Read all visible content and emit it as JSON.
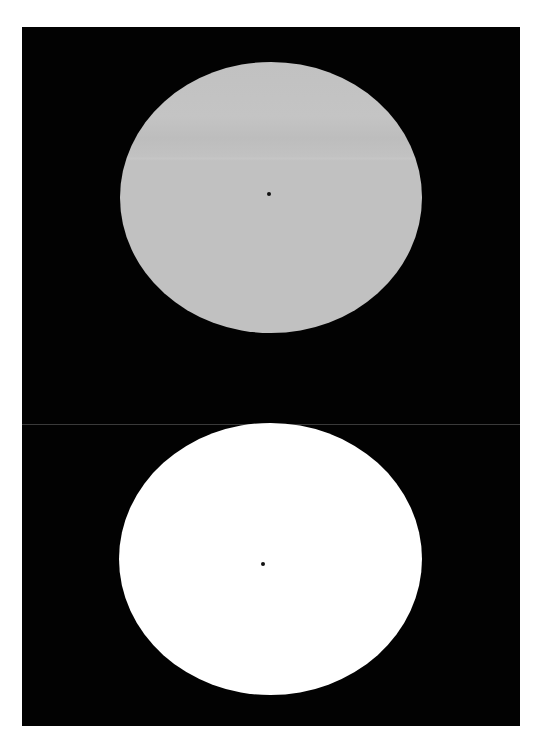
{
  "canvas": {
    "width": 543,
    "height": 751,
    "background": "#ffffff"
  },
  "panel": {
    "color": "#020202",
    "divider_color": "#3a3a3a"
  },
  "stimuli": [
    {
      "name": "top-frame",
      "ellipse_color": "#c1c1c1",
      "dot_color": "#111111",
      "dot_center": [
        269,
        194
      ]
    },
    {
      "name": "bottom-frame",
      "ellipse_color": "#ffffff",
      "dot_color": "#111111",
      "dot_center": [
        263,
        564
      ]
    }
  ]
}
